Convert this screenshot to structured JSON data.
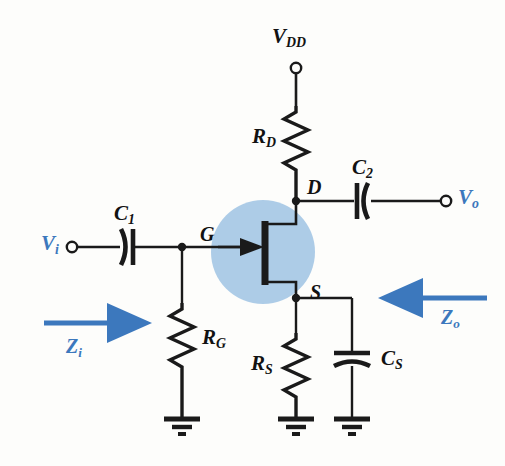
{
  "figure": {
    "background_color": "#fdfdfb",
    "wire_color": "#1a1a1a",
    "accent_blue": "#3c78bd",
    "highlight_blue": "#a9c9e6"
  },
  "terminals": {
    "supply": {
      "label_main": "V",
      "label_sub": "DD",
      "color": "#121212"
    },
    "input": {
      "label_main": "V",
      "label_sub": "i",
      "color": "#3c78bd"
    },
    "output": {
      "label_main": "V",
      "label_sub": "o",
      "color": "#3c78bd"
    }
  },
  "nodes": {
    "drain": {
      "label": "D"
    },
    "gate": {
      "label": "G"
    },
    "source": {
      "label": "S"
    }
  },
  "components": [
    {
      "id": "RD",
      "label_main": "R",
      "label_sub": "D",
      "type": "resistor",
      "orientation": "vertical"
    },
    {
      "id": "RG",
      "label_main": "R",
      "label_sub": "G",
      "type": "resistor",
      "orientation": "vertical"
    },
    {
      "id": "RS",
      "label_main": "R",
      "label_sub": "S",
      "type": "resistor",
      "orientation": "vertical"
    },
    {
      "id": "C1",
      "label_main": "C",
      "label_sub": "1",
      "type": "capacitor",
      "orientation": "horizontal"
    },
    {
      "id": "C2",
      "label_main": "C",
      "label_sub": "2",
      "type": "capacitor",
      "orientation": "horizontal"
    },
    {
      "id": "CS",
      "label_main": "C",
      "label_sub": "S",
      "type": "capacitor",
      "orientation": "vertical"
    },
    {
      "id": "Q1",
      "label": "",
      "type": "jfet-n-channel",
      "orientation": "vertical"
    }
  ],
  "impedances": {
    "input": {
      "label_main": "Z",
      "label_sub": "i",
      "arrow_direction": "right",
      "color": "#3c78bd"
    },
    "output": {
      "label_main": "Z",
      "label_sub": "o",
      "arrow_direction": "left",
      "color": "#3c78bd"
    }
  },
  "grounds": [
    {
      "id": "gnd-rg",
      "bars": 3
    },
    {
      "id": "gnd-rs",
      "bars": 3
    },
    {
      "id": "gnd-cs",
      "bars": 3
    }
  ]
}
